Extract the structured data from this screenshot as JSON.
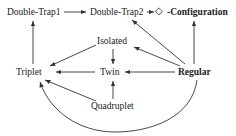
{
  "diagram": {
    "background_color": "#ffffff",
    "line_color": "#333333",
    "text_color": "#1a1a1a",
    "nodes": [
      {
        "id": "double-trap1",
        "label": "Double-Trap1",
        "x": 34,
        "y": 12
      },
      {
        "id": "double-trap2",
        "label": "Double-Trap2",
        "x": 117,
        "y": 12
      },
      {
        "id": "diamond",
        "label": "◇",
        "x": 160,
        "y": 11
      },
      {
        "id": "configuration",
        "label": "-Configuration",
        "x": 200,
        "y": 12
      },
      {
        "id": "isolated",
        "label": "Isolated",
        "x": 113,
        "y": 41
      },
      {
        "id": "triplet",
        "label": "Triplet",
        "x": 33,
        "y": 72
      },
      {
        "id": "twin",
        "label": "Twin",
        "x": 110,
        "y": 72
      },
      {
        "id": "regular",
        "label": "Regular",
        "x": 195,
        "y": 72
      },
      {
        "id": "quadruplet",
        "label": "Quadruplet",
        "x": 115,
        "y": 106
      }
    ],
    "edges": [
      {
        "from": "double-trap1",
        "to": "double-trap2",
        "kind": "straight-horizontal"
      },
      {
        "from": "double-trap2",
        "to": "diamond",
        "kind": "straight-horizontal"
      },
      {
        "from": "triplet",
        "to": "double-trap1",
        "kind": "straight-vertical"
      },
      {
        "from": "regular",
        "to": "configuration",
        "kind": "straight-vertical"
      },
      {
        "from": "regular",
        "to": "double-trap2",
        "kind": "straight-diagonal"
      },
      {
        "from": "regular",
        "to": "isolated",
        "kind": "straight-diagonal"
      },
      {
        "from": "regular",
        "to": "twin",
        "kind": "straight-horizontal"
      },
      {
        "from": "regular",
        "to": "triplet",
        "kind": "curve-below"
      },
      {
        "from": "isolated",
        "to": "twin",
        "kind": "straight-vertical"
      },
      {
        "from": "isolated",
        "to": "triplet",
        "kind": "straight-diagonal"
      },
      {
        "from": "twin",
        "to": "triplet",
        "kind": "straight-horizontal"
      },
      {
        "from": "quadruplet",
        "to": "twin",
        "kind": "straight-vertical"
      },
      {
        "from": "quadruplet",
        "to": "triplet",
        "kind": "straight-diagonal"
      }
    ]
  }
}
